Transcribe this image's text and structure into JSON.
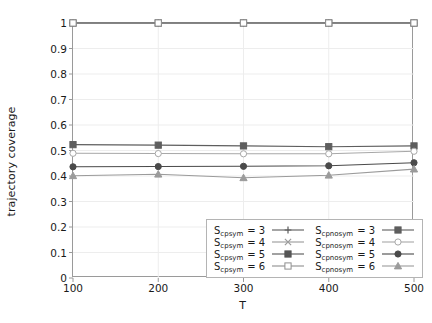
{
  "chart_data": {
    "type": "line",
    "title": "",
    "xlabel": "T",
    "ylabel": "trajectory coverage",
    "x": [
      100,
      200,
      300,
      400,
      500
    ],
    "categories": [
      "100",
      "200",
      "300",
      "400",
      "500"
    ],
    "xlim": [
      100,
      500
    ],
    "ylim": [
      0,
      1
    ],
    "xticks": [
      "100",
      "200",
      "300",
      "400",
      "500"
    ],
    "yticks": [
      "0",
      "0.1",
      "0.2",
      "0.3",
      "0.4",
      "0.5",
      "0.6",
      "0.7",
      "0.8",
      "0.9",
      "1"
    ],
    "grid": true,
    "legend_position": "lower-right-inside",
    "series": [
      {
        "name": "S_cp_sym = 3",
        "label_base": "S",
        "label_sub": "cp",
        "label_sub2": "sym",
        "label_value": "3",
        "group": "sym",
        "marker": "plus",
        "color": "#5b5b5b",
        "values": [
          1,
          1,
          1,
          1,
          1
        ]
      },
      {
        "name": "S_cp_sym = 4",
        "label_base": "S",
        "label_sub": "cp",
        "label_sub2": "sym",
        "label_value": "4",
        "group": "sym",
        "marker": "cross",
        "color": "#9a9a9a",
        "values": [
          1,
          1,
          1,
          1,
          1
        ]
      },
      {
        "name": "S_cp_sym = 5",
        "label_base": "S",
        "label_sub": "cp",
        "label_sub2": "sym",
        "label_value": "5",
        "group": "sym",
        "marker": "filled-square",
        "color": "#555555",
        "values": [
          1,
          1,
          1,
          1,
          1
        ]
      },
      {
        "name": "S_cp_sym = 6",
        "label_base": "S",
        "label_sub": "cp",
        "label_sub2": "sym",
        "label_value": "6",
        "group": "sym",
        "marker": "open-square",
        "color": "#8f8f8f",
        "values": [
          1,
          1,
          1,
          1,
          1
        ]
      },
      {
        "name": "S_cp_nosym = 3",
        "label_base": "S",
        "label_sub": "cp",
        "label_sub2": "nosym",
        "label_value": "3",
        "group": "nosym",
        "marker": "filled-square",
        "color": "#5e5e5e",
        "values": [
          0.523,
          0.521,
          0.518,
          0.515,
          0.518
        ]
      },
      {
        "name": "S_cp_nosym = 4",
        "label_base": "S",
        "label_sub": "cp",
        "label_sub2": "nosym",
        "label_value": "4",
        "group": "nosym",
        "marker": "open-circle",
        "color": "#a8a8a8",
        "values": [
          0.489,
          0.488,
          0.487,
          0.487,
          0.497
        ]
      },
      {
        "name": "S_cp_nosym = 5",
        "label_base": "S",
        "label_sub": "cp",
        "label_sub2": "nosym",
        "label_value": "5",
        "group": "nosym",
        "marker": "filled-circle",
        "color": "#4a4a4a",
        "values": [
          0.436,
          0.437,
          0.438,
          0.44,
          0.452
        ]
      },
      {
        "name": "S_cp_nosym = 6",
        "label_base": "S",
        "label_sub": "cp",
        "label_sub2": "nosym",
        "label_value": "6",
        "group": "nosym",
        "marker": "filled-triangle",
        "color": "#9b9b9b",
        "values": [
          0.401,
          0.407,
          0.393,
          0.403,
          0.427
        ]
      }
    ]
  },
  "axes": {
    "xlabel": "T",
    "ylabel": "trajectory coverage"
  },
  "style": {
    "grid_color": "#ededed",
    "frame_color": "#9a9a9a",
    "text_color": "#1a1a1a",
    "background": "#ffffff"
  }
}
